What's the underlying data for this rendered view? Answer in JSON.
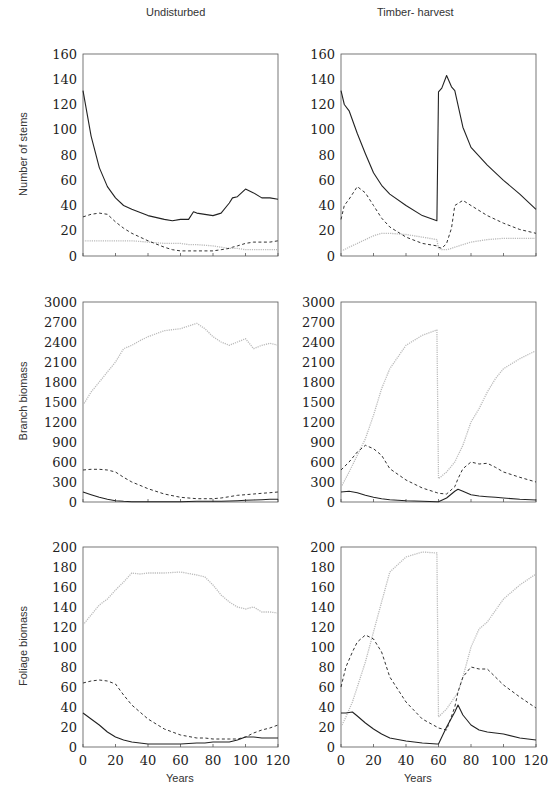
{
  "columns": [
    "Undisturbed",
    "Timber- harvest"
  ],
  "row_labels": [
    "Number of stems",
    "Branch biomass",
    "Foliage biomass"
  ],
  "x_label": "Years",
  "x_ticks": [
    0,
    20,
    40,
    60,
    80,
    100,
    120
  ],
  "chart_data": [
    {
      "type": "line",
      "title": "Undisturbed",
      "ylabel": "Number of stems",
      "xlabel": "",
      "xlim": [
        0,
        120
      ],
      "ylim": [
        0,
        160
      ],
      "yticks": [
        0,
        20,
        40,
        60,
        80,
        100,
        120,
        140,
        160
      ],
      "x": [
        0,
        5,
        10,
        15,
        20,
        25,
        30,
        40,
        50,
        55,
        60,
        65,
        68,
        70,
        80,
        85,
        90,
        92,
        95,
        100,
        105,
        110,
        115,
        120
      ],
      "series": [
        {
          "name": "solid",
          "style": "solid",
          "values": [
            131,
            95,
            70,
            55,
            46,
            40,
            37,
            32,
            29,
            28,
            29,
            29,
            35,
            34,
            32,
            34,
            42,
            46,
            47,
            53,
            50,
            46,
            46,
            45
          ]
        },
        {
          "name": "dashed",
          "style": "dashed",
          "values": [
            31,
            33,
            34,
            33,
            27,
            22,
            18,
            12,
            7,
            5,
            4,
            4,
            4,
            4,
            4,
            5,
            6,
            7,
            8,
            10,
            11,
            11,
            11,
            12
          ]
        },
        {
          "name": "dotted",
          "style": "dotted",
          "values": [
            12,
            12,
            12,
            12,
            12,
            12,
            12,
            11,
            10,
            10,
            10,
            9,
            9,
            9,
            8,
            7,
            6,
            6,
            6,
            5,
            5,
            5,
            5,
            5
          ]
        }
      ]
    },
    {
      "type": "line",
      "title": "Timber- harvest",
      "ylabel": "",
      "xlabel": "",
      "xlim": [
        0,
        120
      ],
      "ylim": [
        0,
        160
      ],
      "yticks": [
        0,
        20,
        40,
        60,
        80,
        100,
        120,
        140,
        160
      ],
      "x": [
        0,
        2,
        5,
        10,
        15,
        20,
        25,
        30,
        40,
        50,
        59,
        60,
        62,
        65,
        68,
        70,
        75,
        80,
        90,
        100,
        110,
        120
      ],
      "series": [
        {
          "name": "solid",
          "style": "solid",
          "values": [
            131,
            120,
            115,
            97,
            81,
            66,
            56,
            49,
            40,
            32,
            28,
            130,
            133,
            143,
            134,
            131,
            102,
            86,
            72,
            60,
            49,
            37
          ]
        },
        {
          "name": "dashed",
          "style": "dashed",
          "values": [
            29,
            40,
            45,
            55,
            50,
            40,
            30,
            23,
            15,
            10,
            8,
            7,
            6,
            10,
            22,
            40,
            44,
            40,
            32,
            26,
            21,
            18
          ]
        },
        {
          "name": "dotted",
          "style": "dotted",
          "values": [
            4,
            5,
            7,
            10,
            13,
            16,
            18,
            18,
            17,
            15,
            13,
            6,
            5,
            5,
            6,
            7,
            9,
            11,
            13,
            14,
            14,
            14
          ]
        }
      ]
    },
    {
      "type": "line",
      "title": "Undisturbed",
      "ylabel": "Branch biomass",
      "xlabel": "",
      "xlim": [
        0,
        120
      ],
      "ylim": [
        0,
        3000
      ],
      "yticks": [
        0,
        300,
        600,
        900,
        1200,
        1500,
        1800,
        2100,
        2400,
        2700,
        3000
      ],
      "x": [
        0,
        5,
        10,
        15,
        20,
        25,
        30,
        35,
        40,
        50,
        60,
        70,
        75,
        80,
        85,
        90,
        95,
        100,
        105,
        110,
        115,
        120
      ],
      "series": [
        {
          "name": "solid",
          "style": "solid",
          "values": [
            150,
            110,
            70,
            40,
            20,
            10,
            5,
            5,
            5,
            5,
            5,
            10,
            10,
            10,
            10,
            15,
            20,
            25,
            30,
            35,
            40,
            40
          ]
        },
        {
          "name": "dashed",
          "style": "dashed",
          "values": [
            480,
            490,
            490,
            480,
            450,
            370,
            300,
            250,
            200,
            120,
            70,
            50,
            50,
            50,
            60,
            80,
            100,
            110,
            120,
            130,
            140,
            150
          ]
        },
        {
          "name": "dotted",
          "style": "dotted",
          "values": [
            1450,
            1650,
            1800,
            1950,
            2100,
            2300,
            2350,
            2420,
            2480,
            2570,
            2600,
            2680,
            2600,
            2480,
            2400,
            2350,
            2400,
            2450,
            2300,
            2350,
            2380,
            2350
          ]
        }
      ]
    },
    {
      "type": "line",
      "title": "Timber- harvest",
      "ylabel": "",
      "xlabel": "",
      "xlim": [
        0,
        120
      ],
      "ylim": [
        0,
        3000
      ],
      "yticks": [
        0,
        300,
        600,
        900,
        1200,
        1500,
        1800,
        2100,
        2400,
        2700,
        3000
      ],
      "x": [
        0,
        5,
        10,
        15,
        20,
        25,
        30,
        40,
        50,
        59,
        60,
        65,
        70,
        72,
        75,
        80,
        85,
        90,
        95,
        100,
        110,
        120
      ],
      "series": [
        {
          "name": "solid",
          "style": "solid",
          "values": [
            150,
            160,
            140,
            100,
            70,
            50,
            35,
            20,
            10,
            5,
            5,
            60,
            160,
            190,
            160,
            110,
            90,
            80,
            70,
            60,
            40,
            30
          ]
        },
        {
          "name": "dashed",
          "style": "dashed",
          "values": [
            480,
            600,
            750,
            850,
            800,
            700,
            500,
            330,
            210,
            140,
            130,
            120,
            230,
            350,
            500,
            600,
            570,
            580,
            520,
            450,
            370,
            300
          ]
        },
        {
          "name": "dotted",
          "style": "dotted",
          "values": [
            220,
            450,
            700,
            950,
            1300,
            1700,
            2000,
            2350,
            2500,
            2580,
            350,
            450,
            600,
            700,
            850,
            1200,
            1400,
            1650,
            1850,
            2000,
            2150,
            2270
          ]
        }
      ]
    },
    {
      "type": "line",
      "title": "Undisturbed",
      "ylabel": "Foliage biomass",
      "xlabel": "Years",
      "xlim": [
        0,
        120
      ],
      "ylim": [
        0,
        200
      ],
      "yticks": [
        0,
        20,
        40,
        60,
        80,
        100,
        120,
        140,
        160,
        180,
        200
      ],
      "x": [
        0,
        5,
        10,
        15,
        20,
        25,
        30,
        35,
        40,
        50,
        60,
        70,
        75,
        80,
        85,
        90,
        95,
        100,
        105,
        110,
        115,
        120
      ],
      "series": [
        {
          "name": "solid",
          "style": "solid",
          "values": [
            34,
            28,
            22,
            15,
            10,
            7,
            5,
            4,
            3,
            3,
            3,
            4,
            4,
            5,
            5,
            5,
            7,
            10,
            10,
            9,
            9,
            9
          ]
        },
        {
          "name": "dashed",
          "style": "dashed",
          "values": [
            64,
            66,
            67,
            66,
            63,
            52,
            42,
            35,
            28,
            18,
            12,
            9,
            9,
            8,
            8,
            8,
            8,
            10,
            14,
            17,
            19,
            22
          ]
        },
        {
          "name": "dotted",
          "style": "dotted",
          "values": [
            122,
            132,
            142,
            148,
            157,
            165,
            174,
            173,
            174,
            174,
            175,
            172,
            170,
            162,
            152,
            145,
            140,
            138,
            140,
            135,
            135,
            134
          ]
        }
      ]
    },
    {
      "type": "line",
      "title": "Timber- harvest",
      "ylabel": "",
      "xlabel": "Years",
      "xlim": [
        0,
        120
      ],
      "ylim": [
        0,
        200
      ],
      "yticks": [
        0,
        20,
        40,
        60,
        80,
        100,
        120,
        140,
        160,
        180,
        200
      ],
      "x": [
        0,
        3,
        7,
        10,
        15,
        20,
        25,
        30,
        40,
        50,
        59,
        60,
        65,
        70,
        72,
        75,
        80,
        85,
        90,
        100,
        110,
        120
      ],
      "series": [
        {
          "name": "solid",
          "style": "solid",
          "values": [
            34,
            34,
            35,
            31,
            24,
            18,
            13,
            9,
            6,
            4,
            3,
            3,
            20,
            35,
            42,
            32,
            22,
            17,
            15,
            13,
            9,
            7
          ]
        },
        {
          "name": "dashed",
          "style": "dashed",
          "values": [
            60,
            80,
            95,
            105,
            112,
            108,
            95,
            70,
            45,
            28,
            20,
            19,
            17,
            40,
            55,
            70,
            80,
            78,
            78,
            62,
            50,
            39
          ]
        },
        {
          "name": "dotted",
          "style": "dotted",
          "values": [
            20,
            30,
            45,
            60,
            85,
            115,
            145,
            175,
            190,
            195,
            194,
            30,
            38,
            50,
            55,
            70,
            100,
            118,
            125,
            148,
            162,
            173
          ]
        }
      ]
    }
  ]
}
